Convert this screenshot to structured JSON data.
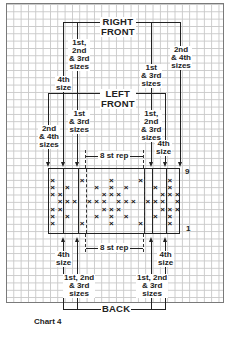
{
  "title": "Chart 4",
  "sections": {
    "right_front": "RIGHT\nFRONT",
    "left_front": "LEFT\nFRONT",
    "back": "BACK"
  },
  "size_labels": {
    "rf_4th": "4th\nsize",
    "rf_123": "1st,\n2nd\n& 3rd\nsizes",
    "rf_13": "1st\n& 3rd\nsizes",
    "rf_24": "2nd\n& 4th\nsizes",
    "lf_24": "2nd\n& 4th\nsizes",
    "lf_13": "1st\n& 3rd\nsizes",
    "lf_123": "1st,\n2nd\n& 3rd\nsizes",
    "lf_4th": "4th\nsize",
    "bk_4th_left": "4th\nsize",
    "bk_123_left": "1st, 2nd\n& 3rd\nsizes",
    "bk_123_right": "1st, 2nd\n& 3rd\nsizes",
    "bk_4th_right": "4th\nsize"
  },
  "repeat_label_top": "8 st rep",
  "repeat_label_bottom": "8 st rep",
  "row_labels": {
    "top": "9",
    "bottom": "1"
  },
  "symbol": "×",
  "grid": {
    "columns": 18,
    "rows": 9,
    "pattern_rows": [
      {
        "row": 9,
        "x_cols": []
      },
      {
        "row": 8,
        "x_cols": [
          0,
          4,
          8,
          12,
          16
        ]
      },
      {
        "row": 7,
        "x_cols": [
          0,
          2,
          6,
          8,
          10,
          14,
          16
        ]
      },
      {
        "row": 6,
        "x_cols": [
          0,
          1,
          7,
          8,
          9,
          15,
          16,
          17
        ]
      },
      {
        "row": 5,
        "x_cols": [
          1,
          2,
          3,
          5,
          6,
          7,
          9,
          10,
          11,
          13,
          14,
          15,
          17
        ]
      },
      {
        "row": 4,
        "x_cols": [
          0,
          1,
          7,
          8,
          9,
          15,
          16,
          17
        ]
      },
      {
        "row": 3,
        "x_cols": [
          0,
          2,
          6,
          8,
          10,
          14,
          16
        ]
      },
      {
        "row": 2,
        "x_cols": [
          0,
          4,
          8,
          12,
          16
        ]
      },
      {
        "row": 1,
        "x_cols": []
      }
    ]
  },
  "colors": {
    "ink": "#222222",
    "grid": "#c9c9c9",
    "paper": "#ffffff"
  }
}
